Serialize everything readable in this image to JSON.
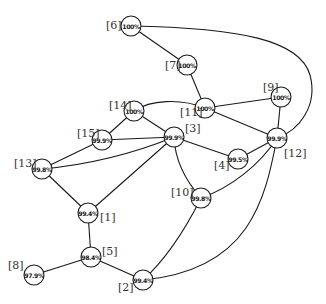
{
  "diagram": {
    "type": "network-graph",
    "node_radius": 10,
    "nodes": [
      {
        "id": "1",
        "label": "[1]",
        "value": "99.4%",
        "x": 88,
        "y": 213,
        "label_dx": 12,
        "label_dy": 4
      },
      {
        "id": "2",
        "label": "[2]",
        "value": "99.4%",
        "x": 143,
        "y": 280,
        "label_dx": -25,
        "label_dy": 7
      },
      {
        "id": "3",
        "label": "[3]",
        "value": "99.9%",
        "x": 174,
        "y": 137,
        "label_dx": 11,
        "label_dy": -9
      },
      {
        "id": "4",
        "label": "[4]",
        "value": "99.5%",
        "x": 238,
        "y": 159,
        "label_dx": -24,
        "label_dy": 6
      },
      {
        "id": "5",
        "label": "[5]",
        "value": "98.4%",
        "x": 91,
        "y": 257,
        "label_dx": 11,
        "label_dy": -6
      },
      {
        "id": "6",
        "label": "[6]",
        "value": "100%",
        "x": 131,
        "y": 26,
        "label_dx": -25,
        "label_dy": -1
      },
      {
        "id": "7",
        "label": "[7]",
        "value": "100%",
        "x": 187,
        "y": 65,
        "label_dx": -22,
        "label_dy": 0
      },
      {
        "id": "8",
        "label": "[8]",
        "value": "97.9%",
        "x": 34,
        "y": 275,
        "label_dx": -26,
        "label_dy": -10
      },
      {
        "id": "9",
        "label": "[9]",
        "value": "100%",
        "x": 281,
        "y": 97,
        "label_dx": -18,
        "label_dy": -10
      },
      {
        "id": "10",
        "label": "[10]",
        "value": "99.8%",
        "x": 201,
        "y": 198,
        "label_dx": -30,
        "label_dy": -6
      },
      {
        "id": "11",
        "label": "[11]",
        "value": "100%",
        "x": 205,
        "y": 108,
        "label_dx": -25,
        "label_dy": 4
      },
      {
        "id": "12",
        "label": "[12]",
        "value": "99.9%",
        "x": 277,
        "y": 138,
        "label_dx": 7,
        "label_dy": 15
      },
      {
        "id": "13",
        "label": "[13]",
        "value": "99.8%",
        "x": 42,
        "y": 169,
        "label_dx": -28,
        "label_dy": -6
      },
      {
        "id": "14",
        "label": "[14]",
        "value": "100%",
        "x": 134,
        "y": 111,
        "label_dx": -25,
        "label_dy": -6
      },
      {
        "id": "15",
        "label": "[15]",
        "value": "99.9%",
        "x": 102,
        "y": 140,
        "label_dx": -25,
        "label_dy": -7
      }
    ],
    "edges": [
      {
        "from": "6",
        "to": "7",
        "path": "M131,26 L187,65"
      },
      {
        "from": "6",
        "to": "12",
        "path": "M131,26 C240,28 300,40 310,75 C318,105 300,130 277,138"
      },
      {
        "from": "7",
        "to": "11",
        "path": "M187,65 L205,108"
      },
      {
        "from": "11",
        "to": "9",
        "path": "M205,108 L281,97"
      },
      {
        "from": "11",
        "to": "12",
        "path": "M205,108 L277,138"
      },
      {
        "from": "11",
        "to": "14",
        "path": "M205,108 C180,98 150,100 134,111"
      },
      {
        "from": "9",
        "to": "12",
        "path": "M281,97 L277,138"
      },
      {
        "from": "14",
        "to": "15",
        "path": "M134,111 L102,140"
      },
      {
        "from": "14",
        "to": "3",
        "path": "M134,111 L174,137"
      },
      {
        "from": "15",
        "to": "3",
        "path": "M102,140 L174,137"
      },
      {
        "from": "15",
        "to": "13",
        "path": "M102,140 L42,169"
      },
      {
        "from": "3",
        "to": "13",
        "path": "M174,137 C130,155 85,165 42,169"
      },
      {
        "from": "3",
        "to": "4",
        "path": "M174,137 L238,159"
      },
      {
        "from": "3",
        "to": "1",
        "path": "M174,137 L88,213"
      },
      {
        "from": "3",
        "to": "10",
        "path": "M174,137 C175,160 185,180 201,198"
      },
      {
        "from": "4",
        "to": "12",
        "path": "M238,159 L277,138"
      },
      {
        "from": "13",
        "to": "1",
        "path": "M42,169 L88,213"
      },
      {
        "from": "10",
        "to": "12",
        "path": "M201,198 C230,188 260,165 277,138"
      },
      {
        "from": "10",
        "to": "2",
        "path": "M201,198 C185,230 165,260 143,280"
      },
      {
        "from": "12",
        "to": "2",
        "path": "M277,138 C265,200 250,270 143,280"
      },
      {
        "from": "1",
        "to": "5",
        "path": "M88,213 L91,257"
      },
      {
        "from": "5",
        "to": "8",
        "path": "M91,257 L34,275"
      },
      {
        "from": "5",
        "to": "2",
        "path": "M91,257 L143,280"
      }
    ]
  }
}
